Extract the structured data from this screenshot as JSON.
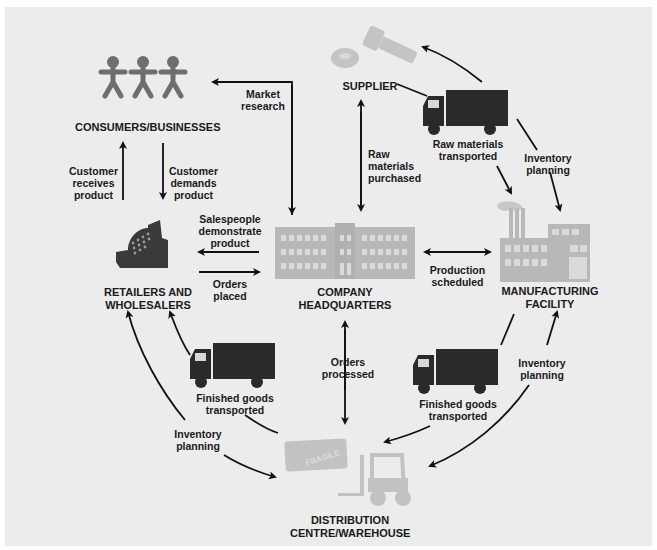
{
  "diagram": {
    "type": "supply-chain-cycle",
    "colors": {
      "background": "#ececec",
      "icon_dark": "#2a2a2a",
      "icon_mid": "#6e6e6e",
      "icon_light": "#b8b8b8",
      "arrow": "#111111",
      "text": "#1a1a1a"
    },
    "nodes": {
      "consumers": "CONSUMERS/BUSINESSES",
      "supplier": "SUPPLIER",
      "retailers_line1": "RETAILERS AND",
      "retailers_line2": "WHOLESALERS",
      "headquarters_line1": "COMPANY",
      "headquarters_line2": "HEADQUARTERS",
      "manufacturing_line1": "MANUFACTURING",
      "manufacturing_line2": "FACILITY",
      "distribution_line1": "DISTRIBUTION",
      "distribution_line2": "CENTRE/WAREHOUSE"
    },
    "edges": {
      "market_research": [
        "Market",
        "research"
      ],
      "customer_receives": [
        "Customer",
        "receives",
        "product"
      ],
      "customer_demands": [
        "Customer",
        "demands",
        "product"
      ],
      "salespeople": [
        "Salespeople",
        "demonstrate",
        "product"
      ],
      "orders_placed": [
        "Orders",
        "placed"
      ],
      "raw_purchased": [
        "Raw",
        "materials",
        "purchased"
      ],
      "raw_transported": [
        "Raw materials",
        "transported"
      ],
      "inventory_top": [
        "Inventory",
        "planning"
      ],
      "production": [
        "Production",
        "scheduled"
      ],
      "orders_processed": [
        "Orders",
        "processed"
      ],
      "finished_left": [
        "Finished goods",
        "transported"
      ],
      "finished_right": [
        "Finished goods",
        "transported"
      ],
      "inventory_left": [
        "Inventory",
        "planning"
      ],
      "inventory_right": [
        "Inventory",
        "planning"
      ]
    },
    "icons": {
      "consumers": "people-icon",
      "supplier": "bolt-nut-icon",
      "retailers": "cash-register-icon",
      "headquarters": "office-building-icon",
      "manufacturing": "factory-icon",
      "distribution": "forklift-crate-icon",
      "fragile_label": "FRAGILE"
    }
  }
}
